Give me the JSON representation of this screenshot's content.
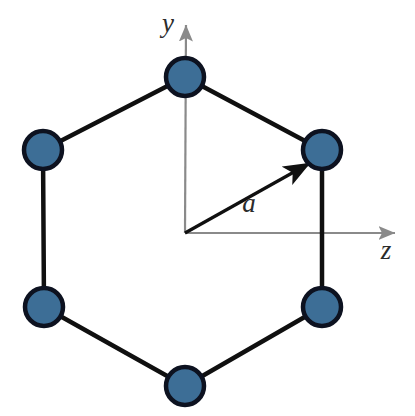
{
  "figure": {
    "width": 415,
    "height": 416,
    "background_color": "#ffffff"
  },
  "colors": {
    "atom_fill": "#3d6e96",
    "atom_stroke": "#0d1220",
    "bond_stroke": "#101010",
    "axis_stroke": "#8a8a8a",
    "vector_stroke": "#101010",
    "label_color": "#2b2b2b"
  },
  "axes": {
    "origin": {
      "x": 185,
      "y": 233
    },
    "y_axis": {
      "label": "y",
      "label_x": 168,
      "label_y": 32,
      "tip_x": 186,
      "tip_y": 25
    },
    "z_axis": {
      "label": "z",
      "label_x": 386,
      "label_y": 259,
      "tip_x": 395,
      "tip_y": 233
    }
  },
  "vector": {
    "label": "a",
    "label_x": 249,
    "label_y": 212,
    "from_x": 185,
    "from_y": 233,
    "to_x": 310,
    "to_y": 163
  },
  "lattice": {
    "atom_radius": 19,
    "atom_stroke_width": 4.5,
    "bond_stroke_width": 4.5,
    "atoms": [
      {
        "name": "atom-top",
        "x": 185,
        "y": 77
      },
      {
        "name": "atom-top-right",
        "x": 322,
        "y": 150
      },
      {
        "name": "atom-bottom-right",
        "x": 322,
        "y": 307
      },
      {
        "name": "atom-bottom",
        "x": 185,
        "y": 386
      },
      {
        "name": "atom-bottom-left",
        "x": 44,
        "y": 307
      },
      {
        "name": "atom-top-left",
        "x": 43,
        "y": 150
      }
    ],
    "bonds": [
      {
        "name": "bond-top-to-top-right",
        "x1": 185,
        "y1": 77,
        "x2": 322,
        "y2": 150
      },
      {
        "name": "bond-top-right-to-bottom-right",
        "x1": 322,
        "y1": 150,
        "x2": 322,
        "y2": 307
      },
      {
        "name": "bond-bottom-right-to-bottom",
        "x1": 322,
        "y1": 307,
        "x2": 185,
        "y2": 386
      },
      {
        "name": "bond-bottom-to-bottom-left",
        "x1": 185,
        "y1": 386,
        "x2": 44,
        "y2": 307
      },
      {
        "name": "bond-bottom-left-to-top-left",
        "x1": 44,
        "y1": 307,
        "x2": 43,
        "y2": 150
      },
      {
        "name": "bond-top-left-to-top",
        "x1": 43,
        "y1": 150,
        "x2": 185,
        "y2": 77
      }
    ]
  },
  "label_font_sizes": {
    "axis": 27,
    "vector": 27
  }
}
